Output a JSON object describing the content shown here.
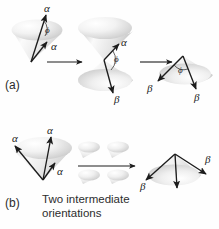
{
  "figure": {
    "width": 219,
    "height": 229,
    "background_color": "#fefefe",
    "ink_color": "#1c1c1c",
    "cone_fill_light": "#ffffff",
    "cone_fill_mid": "#e3e3e3",
    "cone_fill_dark": "#bcbcbc"
  },
  "panels": {
    "a_label": "(a)",
    "b_label": "(b)"
  },
  "caption": {
    "middle_text": "Two intermediate\norientations"
  },
  "symbols": {
    "alpha": "α",
    "beta": "β",
    "phi": "ϕ"
  },
  "row_a": {
    "stage1": {
      "name": "initial-cone-alpha",
      "vector_labels": [
        "α",
        "α"
      ],
      "angle_label": "ϕ"
    },
    "stage2": {
      "name": "double-cone-alpha-beta",
      "vector_labels": [
        "α",
        "β"
      ],
      "angle_label": "ϕ"
    },
    "stage3": {
      "name": "final-cone-beta",
      "vector_labels": [
        "β",
        "β"
      ],
      "angle_label": "ϕ"
    }
  },
  "row_b": {
    "stage1": {
      "name": "initial-cone-three-alpha",
      "vector_labels": [
        "α",
        "α",
        "α"
      ]
    },
    "stage2": {
      "name": "intermediate-orientations-cluster",
      "cone_count": 4
    },
    "stage3": {
      "name": "final-cone-three-beta",
      "vector_labels": [
        "β",
        "β"
      ]
    }
  }
}
